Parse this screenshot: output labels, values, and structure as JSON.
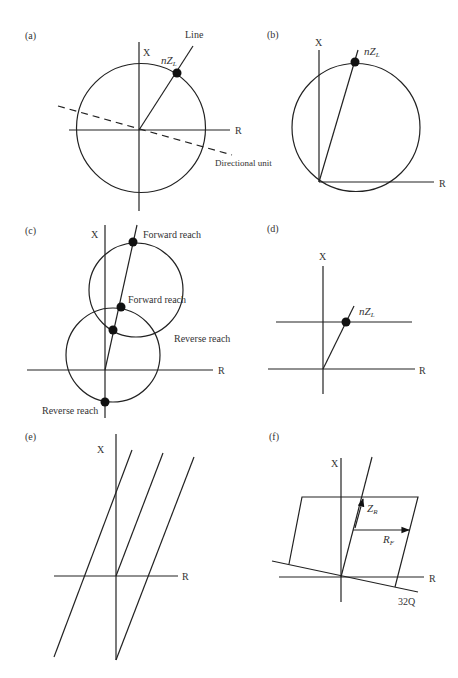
{
  "panels": {
    "a": {
      "label": "(a)",
      "axis_x": "X",
      "axis_r": "R",
      "line_label": "Line",
      "point_label": "nZ",
      "point_sub": "L",
      "directional_label": "Directional unit"
    },
    "b": {
      "label": "(b)",
      "axis_x": "X",
      "axis_r": "R",
      "point_label": "nZ",
      "point_sub": "L"
    },
    "c": {
      "label": "(c)",
      "axis_x": "X",
      "axis_r": "R",
      "forward_reach_top": "Forward reach",
      "forward_reach_mid": "Forward reach",
      "reverse_reach_right": "Reverse reach",
      "reverse_reach_bottom": "Reverse reach"
    },
    "d": {
      "label": "(d)",
      "axis_x": "X",
      "axis_r": "R",
      "point_label": "nZ",
      "point_sub": "L"
    },
    "e": {
      "label": "(e)",
      "axis_x": "X",
      "axis_r": "R"
    },
    "f": {
      "label": "(f)",
      "axis_x": "X",
      "axis_r": "R",
      "zr_label": "Z",
      "zr_sub": "R",
      "rf_label": "R",
      "rf_sub": "F",
      "q_label": "32Q"
    }
  }
}
